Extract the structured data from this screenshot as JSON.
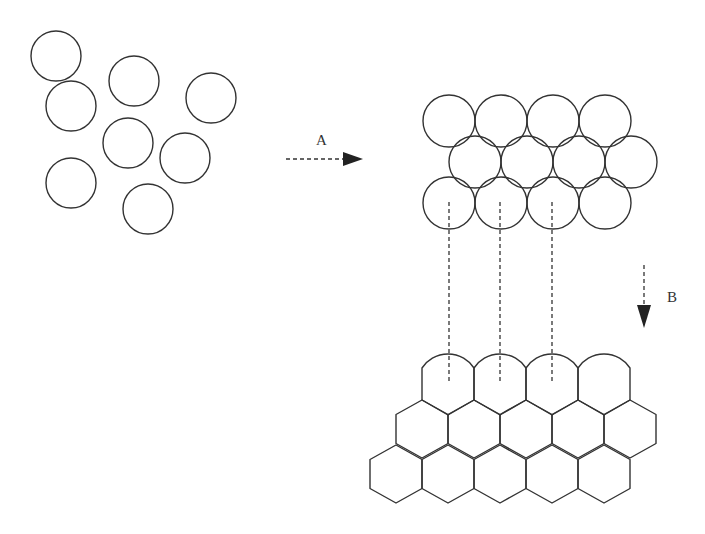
{
  "diagram": {
    "stroke_color": "#333333",
    "background": "#ffffff",
    "scattered_circles": {
      "radius": 25,
      "centers": [
        [
          56,
          56
        ],
        [
          71,
          106
        ],
        [
          134,
          81
        ],
        [
          211,
          98
        ],
        [
          128,
          143
        ],
        [
          185,
          158
        ],
        [
          71,
          183
        ],
        [
          148,
          209
        ]
      ]
    },
    "packed_circles": {
      "radius": 26,
      "rows": [
        {
          "y": 121,
          "xs": [
            449,
            501,
            553,
            605
          ]
        },
        {
          "y": 162,
          "xs": [
            475,
            527,
            579,
            631
          ]
        },
        {
          "y": 203,
          "xs": [
            449,
            501,
            553,
            605
          ]
        }
      ]
    },
    "arrow_a": {
      "label": "A",
      "x1": 286,
      "x2": 363,
      "y": 159,
      "label_x": 316,
      "label_y": 145
    },
    "arrow_b": {
      "label": "B",
      "x": 644,
      "y1": 265,
      "y2": 328,
      "label_x": 667,
      "label_y": 302
    },
    "connector_lines": {
      "xs": [
        449,
        500,
        552
      ],
      "y1": 202,
      "y2": 381
    },
    "hex_grid": {
      "circumradius": 29,
      "cell_width": 52,
      "top_row": {
        "xs": [
          448,
          500,
          552,
          604
        ],
        "side_top_y": 368,
        "side_bottom_y": 400,
        "arc_peak_y": 354,
        "bottom_y": 415
      },
      "middle_row": {
        "y": 429,
        "xs": [
          422,
          474,
          526,
          578,
          630
        ]
      },
      "bottom_row": {
        "y": 474,
        "xs": [
          396,
          448,
          500,
          552,
          604
        ]
      }
    }
  }
}
